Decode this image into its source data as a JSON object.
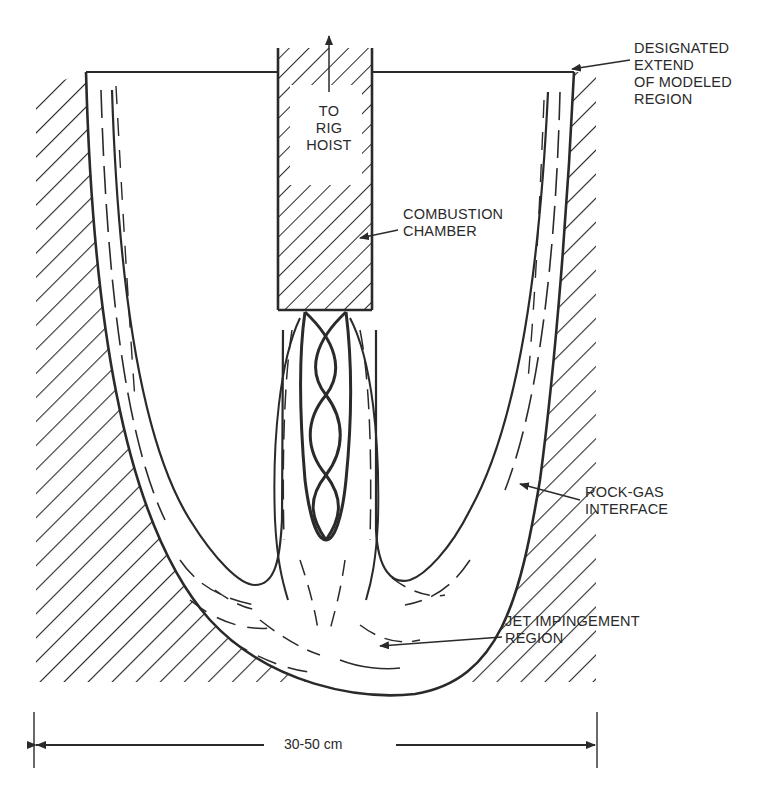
{
  "diagram": {
    "type": "cross-section schematic",
    "labels": {
      "rig_hoist": [
        "TO",
        "RIG",
        "HOIST"
      ],
      "combustion_chamber": [
        "COMBUSTION",
        "CHAMBER"
      ],
      "modeled_region": [
        "DESIGNATED",
        "EXTEND",
        "OF MODELED",
        "REGION"
      ],
      "rock_gas_interface": [
        "ROCK-GAS",
        "INTERFACE"
      ],
      "jet_impingement": [
        "JET IMPINGEMENT",
        "REGION"
      ],
      "dimension": "30-50 cm"
    },
    "colors": {
      "ink": "#2a2a2a",
      "background": "#ffffff"
    }
  }
}
